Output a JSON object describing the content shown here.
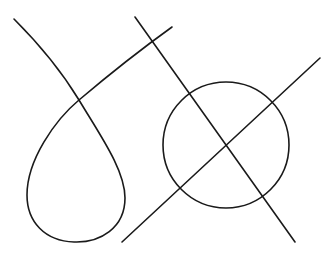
{
  "diagram": {
    "background": "#ffffff",
    "stroke_color": "#1a1a1a",
    "shapes": [
      {
        "name": "loop-curve",
        "type": "path",
        "d": "M14,19 C40,45 62,72 79,100 C100,135 125,170 125,198 C125,228 100,243 74,242 C45,241 27,222 27,195 C27,160 55,120 79,100 C105,78 140,50 172,27"
      },
      {
        "name": "line-descending",
        "type": "line",
        "x1": 135,
        "y1": 17,
        "x2": 295,
        "y2": 242
      },
      {
        "name": "line-ascending",
        "type": "line",
        "x1": 122,
        "y1": 242,
        "x2": 320,
        "y2": 58
      },
      {
        "name": "circle",
        "type": "circle",
        "cx": 226,
        "cy": 145,
        "r": 63
      }
    ]
  }
}
